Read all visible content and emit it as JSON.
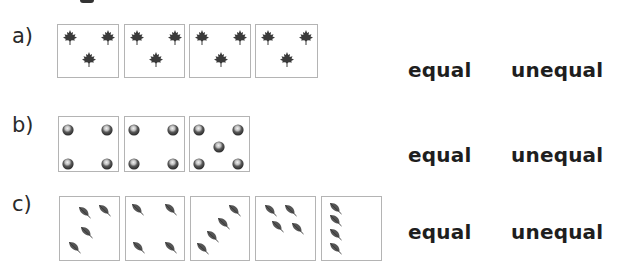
{
  "questions": [
    {
      "label": "a)",
      "item_type": "maple-leaf",
      "boxes": [
        {
          "items": [
            [
              12,
              12
            ],
            [
              50,
              12
            ],
            [
              31,
              34
            ]
          ]
        },
        {
          "items": [
            [
              12,
              12
            ],
            [
              50,
              12
            ],
            [
              31,
              34
            ]
          ]
        },
        {
          "items": [
            [
              12,
              12
            ],
            [
              50,
              12
            ],
            [
              31,
              34
            ]
          ]
        },
        {
          "items": [
            [
              12,
              12
            ],
            [
              50,
              12
            ],
            [
              31,
              34
            ]
          ]
        }
      ],
      "choices": {
        "equal": "equal",
        "unequal": "unequal"
      }
    },
    {
      "label": "b)",
      "item_type": "chestnut",
      "boxes": [
        {
          "items": [
            [
              10,
              11
            ],
            [
              49,
              11
            ],
            [
              10,
              45
            ],
            [
              49,
              45
            ]
          ]
        },
        {
          "items": [
            [
              10,
              11
            ],
            [
              49,
              11
            ],
            [
              10,
              45
            ],
            [
              49,
              45
            ]
          ]
        },
        {
          "items": [
            [
              10,
              11
            ],
            [
              49,
              11
            ],
            [
              30,
              28
            ],
            [
              10,
              45
            ],
            [
              49,
              45
            ]
          ]
        }
      ],
      "choices": {
        "equal": "equal",
        "unequal": "unequal"
      }
    },
    {
      "label": "c)",
      "item_type": "leaf",
      "boxes": [
        {
          "items": [
            [
              25,
              15
            ],
            [
              45,
              13
            ],
            [
              27,
              35
            ],
            [
              15,
              50
            ]
          ]
        },
        {
          "items": [
            [
              12,
              12
            ],
            [
              45,
              12
            ],
            [
              13,
              50
            ],
            [
              45,
              50
            ]
          ]
        },
        {
          "items": [
            [
              44,
              13
            ],
            [
              33,
              26
            ],
            [
              22,
              39
            ],
            [
              12,
              51
            ]
          ]
        },
        {
          "items": [
            [
              15,
              13
            ],
            [
              35,
              13
            ],
            [
              22,
              29
            ],
            [
              42,
              31
            ]
          ]
        },
        {
          "items": [
            [
              14,
              11
            ],
            [
              14,
              23
            ],
            [
              14,
              37
            ],
            [
              14,
              51
            ]
          ]
        }
      ],
      "choices": {
        "equal": "equal",
        "unequal": "unequal"
      }
    }
  ],
  "colors": {
    "box_border": "#b4b4b4",
    "maple_leaf": "#3a3a3a",
    "chestnut": "#4a4a4a",
    "leaf": "#555555",
    "text": "#1e1e1e"
  }
}
